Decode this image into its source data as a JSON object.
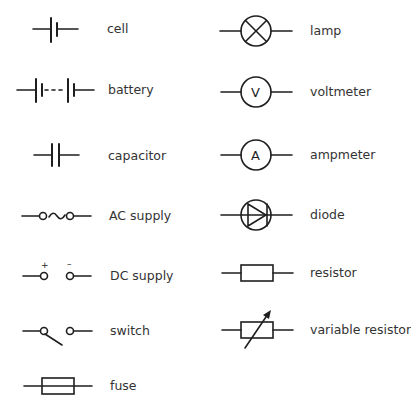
{
  "legend": {
    "left_column": [
      {
        "symbol": "cell-icon",
        "label": "cell"
      },
      {
        "symbol": "battery-icon",
        "label": "battery"
      },
      {
        "symbol": "capacitor-icon",
        "label": "capacitor"
      },
      {
        "symbol": "ac-supply-icon",
        "label": "AC supply"
      },
      {
        "symbol": "dc-supply-icon",
        "label": "DC supply",
        "marks": {
          "plus": "+",
          "minus": "–"
        }
      },
      {
        "symbol": "switch-icon",
        "label": "switch"
      },
      {
        "symbol": "fuse-icon",
        "label": "fuse"
      }
    ],
    "right_column": [
      {
        "symbol": "lamp-icon",
        "label": "lamp"
      },
      {
        "symbol": "voltmeter-icon",
        "label": "voltmeter",
        "letter": "V"
      },
      {
        "symbol": "ammeter-icon",
        "label": "ampmeter",
        "letter": "A"
      },
      {
        "symbol": "diode-icon",
        "label": "diode"
      },
      {
        "symbol": "resistor-icon",
        "label": "resistor"
      },
      {
        "symbol": "variable-resistor-icon",
        "label": "variable resistor"
      }
    ]
  }
}
